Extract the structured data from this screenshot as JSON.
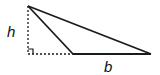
{
  "diagram": {
    "type": "obtuse-triangle-height-base",
    "labels": {
      "height": "h",
      "base": "b"
    },
    "colors": {
      "stroke": "#1a1a1a",
      "background": "#ffffff"
    },
    "points": {
      "apex": [
        28,
        6
      ],
      "foot": [
        28,
        54
      ],
      "base_left": [
        73,
        54
      ],
      "base_right": [
        151,
        54
      ]
    },
    "right_angle_marker": true
  }
}
